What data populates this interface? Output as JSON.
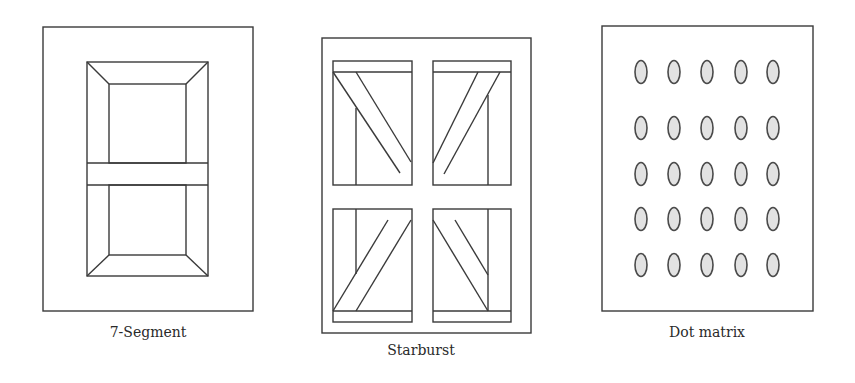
{
  "figure": {
    "panels": [
      {
        "id": "seven-segment",
        "label": "7-Segment"
      },
      {
        "id": "starburst",
        "label": "Starburst"
      },
      {
        "id": "dot-matrix",
        "label": "Dot matrix"
      }
    ],
    "dot_matrix": {
      "rows": 5,
      "columns": 5
    },
    "colors": {
      "line": "#3a3a3a",
      "dot_fill": "#e2e2e2",
      "dot_stroke": "#4a4a4a",
      "background": "#ffffff"
    }
  }
}
